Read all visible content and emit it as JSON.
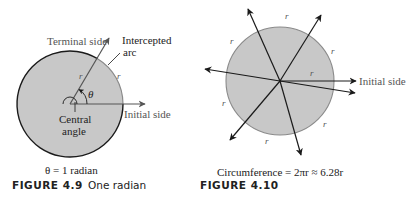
{
  "figure_4_9": {
    "labels": {
      "terminal_side": "Terminal side",
      "intercepted": "Intercepted",
      "arc": "arc",
      "theta": "θ",
      "r1": "r",
      "r2": "r",
      "central": "Central",
      "angle": "angle",
      "initial_side": "Initial side"
    },
    "equation": "θ = 1 radian",
    "caption_label": "FIGURE 4.9",
    "caption_title": "One radian"
  },
  "figure_4_10": {
    "labels": {
      "initial_side": "Initial side",
      "r": [
        "r",
        "r",
        "r",
        "r",
        "r",
        "r",
        "r"
      ]
    },
    "equation": "Circumference = 2πr ≈ 6.28r",
    "caption_label": "FIGURE 4.10",
    "caption_title": ""
  },
  "colors": {
    "circle_fill": "#c8c8c8",
    "circle_stroke_dark": "#1a1a1a",
    "circle_stroke_gray": "#8a8a8a",
    "line": "#1a1a1a",
    "text": "#222222",
    "label_gray": "#555555"
  }
}
